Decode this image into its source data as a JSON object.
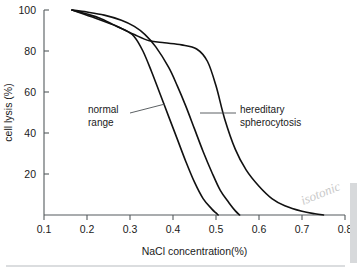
{
  "chart_data": {
    "type": "line",
    "title": "",
    "xlabel": "NaCl concentration(%)",
    "ylabel": "cell lysis (%)",
    "xlim": [
      0.1,
      0.8
    ],
    "ylim": [
      0,
      100
    ],
    "grid": false,
    "legend_position": "inline-annotations",
    "xticks": [
      "0.1",
      "0.2",
      "0.3",
      "0.4",
      "0.5",
      "0.6",
      "0.7",
      "0.8"
    ],
    "xtick_values": [
      0.1,
      0.2,
      0.3,
      0.4,
      0.5,
      0.6,
      0.7,
      0.8
    ],
    "yticks": [
      "20",
      "40",
      "60",
      "80",
      "100"
    ],
    "ytick_values": [
      20,
      40,
      60,
      80,
      100
    ],
    "series": [
      {
        "name": "normal range - upper bound",
        "x": [
          0.165,
          0.2,
          0.24,
          0.28,
          0.31,
          0.335,
          0.36,
          0.39,
          0.41,
          0.43,
          0.45,
          0.47,
          0.49,
          0.51,
          0.53,
          0.545,
          0.555
        ],
        "values": [
          100,
          99,
          97.5,
          95,
          92,
          88,
          82,
          72,
          63,
          53,
          42,
          31,
          21,
          12,
          6,
          2,
          0
        ]
      },
      {
        "name": "normal range - lower bound",
        "x": [
          0.165,
          0.2,
          0.23,
          0.26,
          0.29,
          0.31,
          0.33,
          0.35,
          0.37,
          0.39,
          0.41,
          0.43,
          0.45,
          0.47,
          0.49,
          0.5,
          0.505
        ],
        "values": [
          100,
          98,
          96,
          93,
          90,
          87,
          80,
          70,
          59,
          48,
          37,
          26,
          16,
          8,
          3,
          1,
          0
        ]
      },
      {
        "name": "hereditary spherocytosis",
        "x": [
          0.165,
          0.22,
          0.27,
          0.31,
          0.345,
          0.38,
          0.42,
          0.455,
          0.48,
          0.5,
          0.52,
          0.545,
          0.57,
          0.6,
          0.63,
          0.66,
          0.7,
          0.73,
          0.75
        ],
        "values": [
          100,
          96,
          92,
          88,
          85,
          84,
          83,
          81,
          75,
          63,
          47,
          32,
          22,
          14,
          8,
          4.5,
          1.8,
          0.6,
          0
        ]
      }
    ],
    "annotations": [
      {
        "label_line1": "normal",
        "label_line2": "range",
        "points_to": "normal range hatched band"
      },
      {
        "label_line1": "hereditary",
        "label_line2": "spherocytosis",
        "points_to": "hereditary spherocytosis curve"
      },
      {
        "label_line1": "isotonic",
        "style": "handwritten-annotation"
      }
    ]
  },
  "colors": {
    "background": "#ffffff",
    "curve": "#111111",
    "axis": "#555b5e",
    "text": "#1a1a1a",
    "handwriting": "#c9c9c9"
  }
}
